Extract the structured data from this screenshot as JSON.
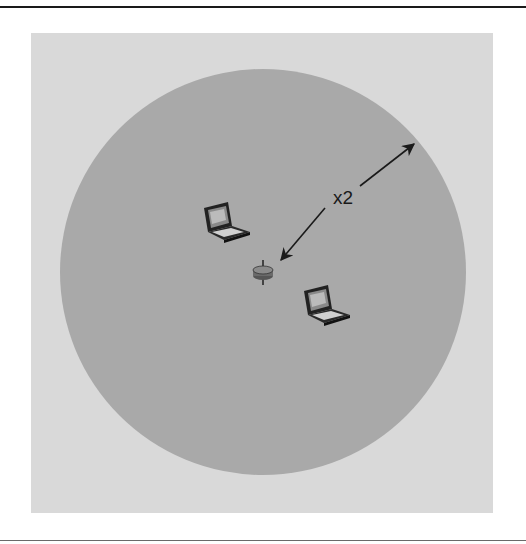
{
  "figure": {
    "type": "wireless-coverage-diagram",
    "coverage_area": {
      "shape": "circle",
      "fill": "#a9a9a9",
      "background": "#d9d9d9"
    },
    "access_point": {
      "icon": "access-point-icon"
    },
    "clients": [
      {
        "icon": "laptop-icon"
      },
      {
        "icon": "laptop-icon"
      }
    ],
    "radius_arrow": {
      "label": "x2"
    }
  }
}
